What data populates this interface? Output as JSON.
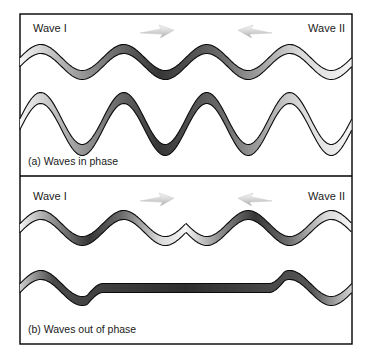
{
  "figure": {
    "title_alt": "Wave interference: in phase and out of phase",
    "background_color": "#ffffff",
    "frame": {
      "x": 20,
      "y": 14,
      "width": 332,
      "height": 330,
      "border_color": "#000000"
    },
    "divider_y": 176
  },
  "panels": [
    {
      "id": "panel-a",
      "caption": "(a) Waves in phase",
      "caption_x": 28,
      "caption_y": 165,
      "left_label": "Wave I",
      "right_label": "Wave II",
      "left_label_x": 33,
      "right_label_x": 345,
      "label_y": 32,
      "arrows": [
        {
          "name": "arrow-right",
          "x": 140,
          "y": 25,
          "direction": "right"
        },
        {
          "name": "arrow-left",
          "x": 238,
          "y": 25,
          "direction": "left"
        }
      ],
      "waves": [
        {
          "name": "incident-wave-pair",
          "baseline": 62,
          "amplitude": 13,
          "wavelength": 83,
          "phase": 0,
          "ribbon_offset": 9,
          "x_start": 20,
          "x_end": 352,
          "split_at": null
        },
        {
          "name": "resultant-wave",
          "baseline": 124,
          "amplitude": 26,
          "wavelength": 83,
          "phase": 0,
          "ribbon_offset": 11,
          "x_start": 20,
          "x_end": 352,
          "split_at": null,
          "taper": true
        }
      ]
    },
    {
      "id": "panel-b",
      "caption": "(b) Waves out of phase",
      "caption_x": 28,
      "caption_y": 333,
      "left_label": "Wave I",
      "right_label": "Wave II",
      "left_label_x": 33,
      "right_label_x": 345,
      "label_y": 200,
      "arrows": [
        {
          "name": "arrow-right",
          "x": 140,
          "y": 193,
          "direction": "right"
        },
        {
          "name": "arrow-left",
          "x": 238,
          "y": 193,
          "direction": "left"
        }
      ],
      "waves": [
        {
          "name": "incident-wave-left",
          "baseline": 228,
          "amplitude": 13,
          "wavelength": 83,
          "phase": 0,
          "ribbon_offset": 9,
          "x_start": 20,
          "x_end": 186,
          "split_at": null
        },
        {
          "name": "incident-wave-right",
          "baseline": 228,
          "amplitude": 13,
          "wavelength": 83,
          "phase": 0.5,
          "ribbon_offset": 9,
          "x_start": 186,
          "x_end": 352,
          "split_at": null
        },
        {
          "name": "cancelled-wave",
          "baseline": 288,
          "amplitude": 13,
          "wavelength": 83,
          "phase": 0,
          "ribbon_offset": 9,
          "x_start": 20,
          "x_end": 352,
          "flat_from": 103,
          "flat_to": 269
        }
      ]
    }
  ],
  "chart_data": {
    "type": "line",
    "xlabel": "",
    "ylabel": "",
    "grid": false,
    "legend_position": "none",
    "annotations": [
      "(a) Waves in phase",
      "(b) Waves out of phase",
      "Wave I",
      "Wave II"
    ],
    "series": [
      {
        "name": "panel-a incident waves",
        "panel": "a",
        "wavelength_px": 83,
        "amplitude_px": 13,
        "phase_cycles": 0,
        "description": "Two identical sinusoids overlapping in phase"
      },
      {
        "name": "panel-a resultant wave",
        "panel": "a",
        "wavelength_px": 83,
        "amplitude_px": 26,
        "phase_cycles": 0,
        "description": "Constructive interference, amplitude doubled"
      },
      {
        "name": "panel-b wave I",
        "panel": "b",
        "wavelength_px": 83,
        "amplitude_px": 13,
        "phase_cycles": 0,
        "description": "Left-travelling sinusoid, ends at midpoint"
      },
      {
        "name": "panel-b wave II",
        "panel": "b",
        "wavelength_px": 83,
        "amplitude_px": 13,
        "phase_cycles": 0.5,
        "description": "Right-travelling sinusoid shifted half a wavelength"
      },
      {
        "name": "panel-b resultant wave",
        "panel": "b",
        "wavelength_px": 83,
        "amplitude_px": 0,
        "phase_cycles": 0,
        "description": "Destructive interference, flat through overlap region"
      }
    ]
  },
  "colors": {
    "outline": "#0a0a0a",
    "ribbon_dark": "#3a3a3a",
    "ribbon_mid": "#8c8c8c",
    "ribbon_light": "#f2f2f2",
    "arrow_light": "#f0f0f0",
    "arrow_dark": "#a8a8a8",
    "text": "#1a1a1a"
  }
}
